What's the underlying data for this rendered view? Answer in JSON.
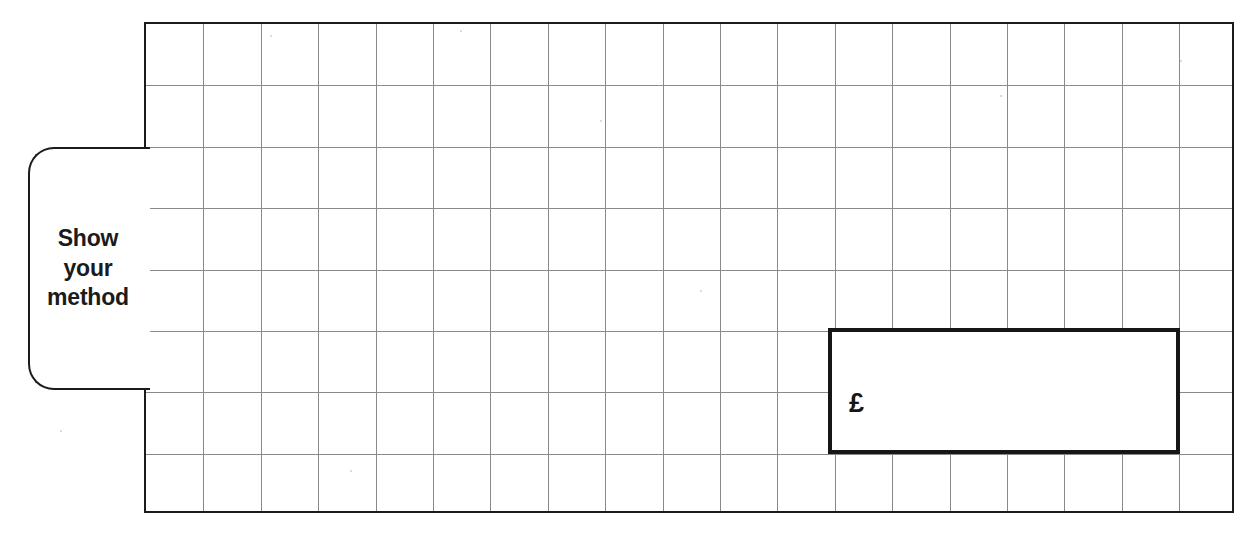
{
  "page": {
    "background_color": "#ffffff",
    "width": 1256,
    "height": 534
  },
  "callout": {
    "label": "Show\nyour\nmethod",
    "lines": [
      "Show",
      "your",
      "method"
    ],
    "border_color": "#1b1b1b",
    "text_color": "#1b1b1b"
  },
  "answer_box": {
    "currency_symbol": "£",
    "value": "",
    "border_color": "#161616",
    "fill_color": "#ffffff"
  },
  "grid": {
    "columns": 19,
    "rows": 8,
    "cell_width": 57.4,
    "cell_height": 61.4,
    "line_color": "#8a8a8a",
    "border_color": "#1b1b1b"
  }
}
